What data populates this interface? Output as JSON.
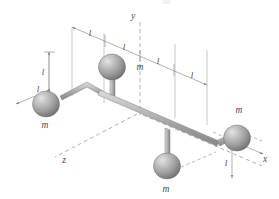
{
  "figure": {
    "type": "physics-3d-diagram",
    "background_color": "#ffffff",
    "sphere_color": "#9a9a9a",
    "sphere_highlight_color": "#d8d8d8",
    "rod_color": "#b4b4b4",
    "line_color": "#8f8f8f",
    "label_color": "#4a4a4a"
  },
  "axes": {
    "x_label": "x",
    "y_label": "y",
    "z_label": "z"
  },
  "masses": [
    {
      "id": "mass-left",
      "label": "m",
      "position": "far left on bent arm"
    },
    {
      "id": "mass-top",
      "label": "m",
      "position": "upper, on vertical rod above main axis"
    },
    {
      "id": "mass-bottom",
      "label": "m",
      "position": "lower, on vertical rod below main axis"
    },
    {
      "id": "mass-right",
      "label": "m",
      "position": "far right on bent arm"
    }
  ],
  "dimensions": {
    "top_chain": [
      {
        "id": "dim-top-1",
        "label": "l"
      },
      {
        "id": "dim-top-2",
        "label": "l"
      },
      {
        "id": "dim-top-3",
        "label": "l"
      },
      {
        "id": "dim-top-4",
        "label": "l"
      }
    ],
    "left_vertical": {
      "id": "dim-left-vertical",
      "label": "l"
    },
    "left_diagonal": {
      "id": "dim-left-diagonal",
      "label": "l"
    },
    "right_diagonal": {
      "id": "dim-right-diagonal",
      "label": "l"
    },
    "right_vertical": {
      "id": "dim-right-vertical",
      "label": "l"
    }
  }
}
